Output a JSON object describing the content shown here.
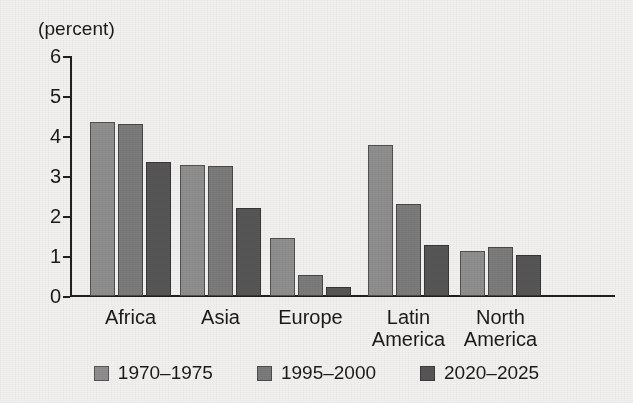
{
  "chart_data": {
    "type": "bar",
    "title": "",
    "subtitle": "",
    "unit_label": "(percent)",
    "xlabel": "",
    "ylabel": "",
    "ylim": [
      0,
      6
    ],
    "y_ticks": [
      "0",
      "1",
      "2",
      "3",
      "4",
      "5",
      "6"
    ],
    "grid": false,
    "legend_position": "bottom",
    "categories": [
      "Africa",
      "Asia",
      "Europe",
      "Latin\nAmerica",
      "North\nAmerica"
    ],
    "series": [
      {
        "name": "1970–1975",
        "color": "#8e8e8e",
        "values": [
          4.35,
          3.28,
          1.45,
          3.78,
          1.13
        ]
      },
      {
        "name": "1995–2000",
        "color": "#7b7b7b",
        "values": [
          4.3,
          3.25,
          0.53,
          2.3,
          1.23
        ]
      },
      {
        "name": "2020–2025",
        "color": "#565656",
        "values": [
          3.35,
          2.2,
          0.22,
          1.28,
          1.03
        ]
      }
    ]
  },
  "legend": {
    "items": [
      {
        "label": "1970–1975"
      },
      {
        "label": "1995–2000"
      },
      {
        "label": "2020–2025"
      }
    ]
  }
}
